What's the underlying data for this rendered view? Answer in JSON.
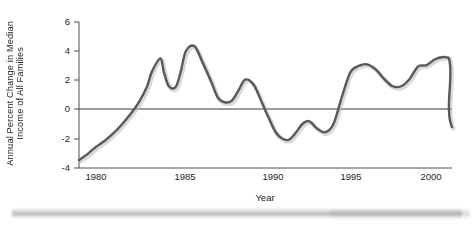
{
  "chart": {
    "type": "line",
    "ylabel_line1": "Annual Percent Change in Median",
    "ylabel_line2": "Income of All Families",
    "xlabel": "Year",
    "line_color": "#595959",
    "axis_color": "#3b3b3b",
    "y_ticks": [
      "6",
      "4",
      "2",
      "0",
      "-2",
      "-4"
    ],
    "x_ticks": [
      "1980",
      "1985",
      "1990",
      "1995",
      "2000"
    ]
  },
  "chart_data": {
    "type": "line",
    "title": "",
    "xlabel": "Year",
    "ylabel": "Annual Percent Change in Median Income of All Families",
    "xlim": [
      1979,
      2001
    ],
    "ylim": [
      -4,
      6
    ],
    "xticks": [
      1980,
      1985,
      1990,
      1995,
      2000
    ],
    "yticks": [
      -4,
      -2,
      0,
      2,
      4,
      6
    ],
    "grid": false,
    "legend": "none",
    "zero_reference_line": 0,
    "series": [
      {
        "name": "Annual Percent Change in Median Income of All Families",
        "color": "#595959",
        "x": [
          1979.0,
          1979.5,
          1980.0,
          1980.5,
          1981.0,
          1981.5,
          1982.0,
          1982.5,
          1983.0,
          1983.3,
          1983.8,
          1984.0,
          1984.3,
          1984.7,
          1985.0,
          1985.3,
          1985.8,
          1986.3,
          1986.8,
          1987.2,
          1987.6,
          1988.0,
          1988.4,
          1988.8,
          1989.3,
          1989.8,
          1990.2,
          1990.6,
          1991.0,
          1991.4,
          1991.8,
          1992.2,
          1992.6,
          1993.0,
          1993.5,
          1994.0,
          1994.5,
          1995.0,
          1995.5,
          1996.0,
          1996.5,
          1997.0,
          1997.5,
          1998.0,
          1998.5,
          1999.0,
          1999.5,
          2000.0,
          2000.5,
          2000.8
        ],
        "y": [
          -3.45,
          -3.05,
          -2.55,
          -2.15,
          -1.65,
          -1.05,
          -0.35,
          0.45,
          1.55,
          2.6,
          3.5,
          2.6,
          1.6,
          1.55,
          2.6,
          4.0,
          4.35,
          3.2,
          1.9,
          0.8,
          0.5,
          0.6,
          1.3,
          2.05,
          1.7,
          0.45,
          -0.6,
          -1.55,
          -2.0,
          -2.05,
          -1.55,
          -0.95,
          -0.8,
          -1.25,
          -1.55,
          -1.0,
          0.85,
          2.55,
          3.0,
          3.1,
          2.75,
          2.1,
          1.6,
          1.6,
          2.1,
          2.95,
          3.05,
          3.45,
          3.6,
          3.55
        ],
        "annotations": [
          {
            "label": "peak 1983",
            "x": 1983.8,
            "y": 3.5
          },
          {
            "label": "peak 1985",
            "x": 1985.8,
            "y": 4.35
          },
          {
            "label": "trough 1991",
            "x": 1991.4,
            "y": -2.05
          },
          {
            "label": "peak 1997",
            "x": 1997.3,
            "y": 3.6
          },
          {
            "label": "end 2001",
            "x": 2001.0,
            "y": -1.2
          }
        ]
      }
    ]
  }
}
